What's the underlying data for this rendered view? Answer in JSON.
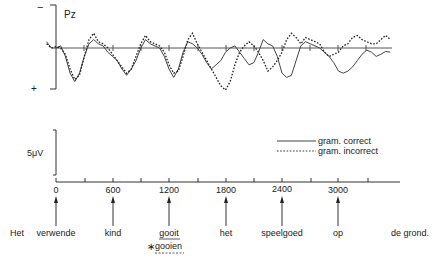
{
  "chart_data": {
    "type": "line",
    "title": "",
    "channel": "Pz",
    "polarity": {
      "top": "−",
      "bottom": "+"
    },
    "calibration": "5μV",
    "xlabel": "",
    "ylabel": "",
    "x_unit": "ms",
    "x_ticks": [
      0,
      600,
      1200,
      1800,
      2400,
      3000
    ],
    "x_tick_labels": [
      "0",
      "600",
      "1200",
      "1800",
      "2400",
      "3000"
    ],
    "xlim": [
      -100,
      3600
    ],
    "ylim_uV": [
      -8,
      8
    ],
    "grid": false,
    "legend_position": "right, below traces",
    "series": [
      {
        "name": "gram. correct",
        "style": "solid",
        "x": [
          -100,
          -50,
          0,
          50,
          100,
          150,
          200,
          250,
          300,
          350,
          400,
          450,
          500,
          550,
          600,
          650,
          700,
          750,
          800,
          850,
          900,
          950,
          1000,
          1050,
          1100,
          1150,
          1200,
          1250,
          1300,
          1350,
          1400,
          1450,
          1500,
          1550,
          1600,
          1650,
          1700,
          1750,
          1800,
          1850,
          1900,
          1950,
          2000,
          2050,
          2100,
          2150,
          2200,
          2250,
          2300,
          2350,
          2400,
          2450,
          2500,
          2550,
          2600,
          2650,
          2700,
          2750,
          2800,
          2850,
          2900,
          2950,
          3000,
          3050,
          3100,
          3150,
          3200,
          3250,
          3300,
          3350,
          3400,
          3450,
          3500,
          3550
        ],
        "values_uV": [
          1.5,
          0,
          0,
          0.5,
          -2,
          -6,
          -8,
          -6,
          -2,
          1,
          2,
          1,
          0.5,
          -1,
          -2,
          -3,
          -5,
          -6.5,
          -5,
          -3,
          0,
          2,
          1,
          0.5,
          0,
          -2,
          -5,
          -7,
          -5,
          -1,
          1.5,
          1,
          0,
          -1.5,
          -3.5,
          -5,
          -4,
          -3,
          -1,
          0,
          0.5,
          -1,
          -2.5,
          -4,
          -3.5,
          -1,
          2,
          1,
          0.5,
          -2,
          -6,
          -7,
          -6.5,
          -3,
          0.5,
          1.5,
          1,
          0.5,
          0,
          -1,
          -2,
          -3.5,
          -5.5,
          -6,
          -5.5,
          -4.5,
          -3,
          -1.5,
          -0.5,
          -1,
          -2,
          -1.5,
          -0.8,
          -1
        ]
      },
      {
        "name": "gram. incorrect",
        "style": "dashed",
        "x": [
          -100,
          -50,
          0,
          50,
          100,
          150,
          200,
          250,
          300,
          350,
          400,
          450,
          500,
          550,
          600,
          650,
          700,
          750,
          800,
          850,
          900,
          950,
          1000,
          1050,
          1100,
          1150,
          1200,
          1250,
          1300,
          1350,
          1400,
          1450,
          1500,
          1550,
          1600,
          1650,
          1700,
          1750,
          1800,
          1850,
          1900,
          1950,
          2000,
          2050,
          2100,
          2150,
          2200,
          2250,
          2300,
          2350,
          2400,
          2450,
          2500,
          2550,
          2600,
          2650,
          2700,
          2750,
          2800,
          2850,
          2900,
          2950,
          3000,
          3050,
          3100,
          3150,
          3200,
          3250,
          3300,
          3350,
          3400,
          3450,
          3500,
          3550
        ],
        "values_uV": [
          1,
          0,
          0.3,
          0,
          -1.5,
          -5,
          -7.5,
          -6.5,
          -2,
          2,
          3.5,
          1.5,
          1,
          0,
          -1.5,
          -3,
          -4.5,
          -6,
          -5,
          -2,
          1,
          3,
          1.5,
          1,
          0.5,
          -1,
          -4,
          -6,
          -5.5,
          -2,
          2,
          3.5,
          1,
          -1,
          -3,
          -5,
          -7,
          -9,
          -10,
          -8,
          -4,
          -1,
          0.5,
          1.5,
          0.5,
          -1,
          -3,
          -5.5,
          -4.5,
          -3,
          -1,
          2,
          3.5,
          2.5,
          1,
          2.5,
          2,
          1.5,
          1,
          -1,
          -2,
          -1.5,
          -1,
          0.5,
          1,
          2.5,
          3,
          2,
          1.5,
          1,
          1,
          2,
          3,
          2
        ]
      }
    ],
    "annotations": {
      "sentence_words": [
        {
          "word": "Het",
          "onset_ms": null
        },
        {
          "word": "verwende",
          "onset_ms": 0
        },
        {
          "word": "kind",
          "onset_ms": 600
        },
        {
          "word": "gooit",
          "onset_ms": 1200,
          "underlined": true
        },
        {
          "word": "het",
          "onset_ms": 1800
        },
        {
          "word": "speelgoed",
          "onset_ms": 2400
        },
        {
          "word": "op",
          "onset_ms": 3000
        },
        {
          "word": "de grond.",
          "onset_ms": null
        }
      ],
      "violation_alternative": {
        "marker": "∗",
        "word": "gooien",
        "under": "gooit"
      }
    }
  },
  "labels": {
    "channel": "Pz",
    "minus": "−",
    "plus": "+",
    "calibration": "5μV",
    "legend_correct": "gram. correct",
    "legend_incorrect": "gram. incorrect",
    "ticks": [
      "0",
      "600",
      "1200",
      "1800",
      "2400",
      "3000"
    ],
    "words": {
      "het1": "Het",
      "verwende": "verwende",
      "kind": "kind",
      "gooit": "gooit",
      "het2": "het",
      "speelgoed": "speelgoed",
      "op": "op",
      "degrond": "de grond."
    },
    "star": "∗",
    "gooien": "gooien"
  }
}
